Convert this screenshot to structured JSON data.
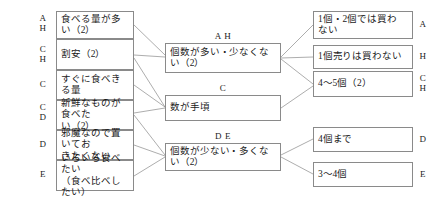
{
  "diagram": {
    "type": "affinity-relation-diagram",
    "language": "ja",
    "left_column": [
      {
        "tag": "A\nH",
        "text": "食べる量が多い（2）"
      },
      {
        "tag": "C\nH",
        "text": "割安（2）"
      },
      {
        "tag": "C",
        "text": "すぐに食べきる量"
      },
      {
        "tag": "C\nD",
        "text": "新鮮なものが食べた\nい（2）"
      },
      {
        "tag": "D",
        "text": "邪魔なので置いてお\nきたくない"
      },
      {
        "tag": "E",
        "text": "いろいろ食べたい\n（食べ比べしたい）"
      }
    ],
    "middle_column": [
      {
        "tag": "A H",
        "text": "個数が多い・少なくな\nい（2）"
      },
      {
        "tag": "C",
        "text": "数が手頃"
      },
      {
        "tag": "D E",
        "text": "個数が少ない・多くな\nい（2）"
      }
    ],
    "right_column": [
      {
        "tag": "A",
        "text": "1個・2個では買わ\nない"
      },
      {
        "tag": "H",
        "text": "1個売りは買わない"
      },
      {
        "tag": "C\nH",
        "text": "4〜5個（2）"
      },
      {
        "tag": "D",
        "text": "4個まで"
      },
      {
        "tag": "E",
        "text": "3〜4個"
      }
    ],
    "edges": [
      {
        "from": "left-0",
        "to": "middle-0"
      },
      {
        "from": "left-1",
        "to": "middle-0"
      },
      {
        "from": "left-1",
        "to": "middle-1"
      },
      {
        "from": "left-2",
        "to": "middle-1"
      },
      {
        "from": "left-3",
        "to": "middle-1"
      },
      {
        "from": "left-3",
        "to": "middle-2"
      },
      {
        "from": "left-4",
        "to": "middle-2"
      },
      {
        "from": "left-5",
        "to": "middle-2"
      },
      {
        "from": "middle-0",
        "to": "right-0"
      },
      {
        "from": "middle-0",
        "to": "right-1"
      },
      {
        "from": "middle-0",
        "to": "right-2"
      },
      {
        "from": "middle-1",
        "to": "right-2"
      },
      {
        "from": "middle-2",
        "to": "right-3"
      },
      {
        "from": "middle-2",
        "to": "right-4"
      }
    ],
    "colors": {
      "border": "#8a8a8a",
      "line": "#8a8a8a",
      "text": "#1a1a1a",
      "background": "#ffffff"
    }
  }
}
